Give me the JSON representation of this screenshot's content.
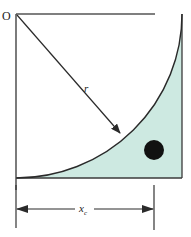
{
  "diagram": {
    "origin_label": "O",
    "radius_label": "r",
    "dimension_label_main": "x",
    "dimension_label_sub": "c",
    "colors": {
      "shaded_region": "#cde9e1",
      "stroke": "#2a2a2a",
      "frame": "#555555",
      "particle": "#111111",
      "background": "#ffffff"
    }
  }
}
